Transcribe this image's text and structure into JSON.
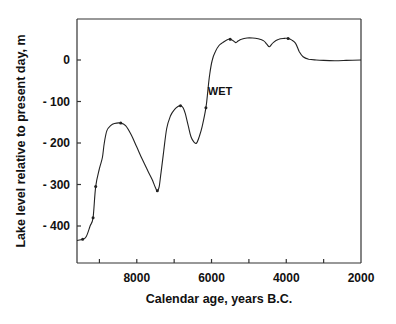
{
  "chart_data": {
    "type": "line",
    "title": "",
    "xlabel": "Calendar age, years B.C.",
    "ylabel": "Lake level relative to present day, m",
    "xlim": [
      9600,
      2000
    ],
    "ylim": [
      -490,
      95
    ],
    "x_reversed": true,
    "grid": false,
    "legend": null,
    "xticks": [
      9000,
      8000,
      7000,
      6000,
      5000,
      4000,
      3000,
      2000
    ],
    "xtick_labels": [
      "",
      "8000",
      "",
      "6000",
      "",
      "4000",
      "",
      "2000"
    ],
    "yticks": [
      0,
      -100,
      -200,
      -300,
      -400
    ],
    "ytick_labels": [
      "0",
      "- 100",
      "- 200",
      "- 300",
      "- 400"
    ],
    "annotations": [
      {
        "text": "WET",
        "x": 6100,
        "y": -75
      }
    ],
    "series": [
      {
        "name": "Lake level",
        "x": [
          9600,
          9450,
          9350,
          9250,
          9170,
          9100,
          9000,
          8920,
          8870,
          8800,
          8700,
          8600,
          8430,
          8300,
          8150,
          8000,
          7850,
          7700,
          7580,
          7500,
          7450,
          7400,
          7350,
          7280,
          7200,
          7100,
          7000,
          6900,
          6830,
          6760,
          6700,
          6620,
          6550,
          6470,
          6400,
          6330,
          6250,
          6150,
          6100,
          6050,
          5980,
          5900,
          5800,
          5700,
          5550,
          5450,
          5350,
          5300,
          5200,
          5050,
          4900,
          4750,
          4600,
          4520,
          4450,
          4350,
          4200,
          4050,
          3950,
          3850,
          3750,
          3650,
          3550,
          3400,
          3200,
          3000,
          2700,
          2400,
          2000
        ],
        "y": [
          -435,
          -432,
          -425,
          -400,
          -380,
          -305,
          -262,
          -235,
          -200,
          -170,
          -158,
          -153,
          -152,
          -158,
          -180,
          -210,
          -240,
          -268,
          -290,
          -308,
          -315,
          -305,
          -270,
          -220,
          -165,
          -135,
          -120,
          -112,
          -110,
          -115,
          -130,
          -160,
          -185,
          -198,
          -200,
          -185,
          -160,
          -115,
          -75,
          -35,
          0,
          20,
          35,
          42,
          50,
          48,
          42,
          45,
          50,
          53,
          53,
          51,
          46,
          38,
          32,
          42,
          50,
          52,
          52,
          48,
          40,
          20,
          8,
          2,
          0,
          -1,
          -2,
          -1,
          0
        ],
        "markers": [
          {
            "x": 9450,
            "y": -432
          },
          {
            "x": 9170,
            "y": -380
          },
          {
            "x": 9100,
            "y": -305
          },
          {
            "x": 8430,
            "y": -152
          },
          {
            "x": 7450,
            "y": -315
          },
          {
            "x": 6830,
            "y": -110
          },
          {
            "x": 6150,
            "y": -115
          },
          {
            "x": 5500,
            "y": 50
          },
          {
            "x": 3950,
            "y": 52
          }
        ],
        "color": "#222222"
      }
    ]
  },
  "plot": {
    "frame": {
      "left": 77,
      "top": 19,
      "right": 361,
      "bottom": 263
    },
    "line_color": "#222222",
    "axis_color": "#333333"
  }
}
